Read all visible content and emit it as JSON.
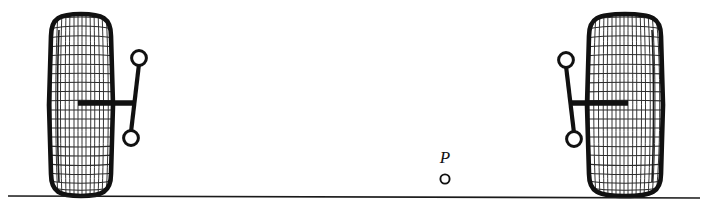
{
  "figure": {
    "background_color": "#ffffff",
    "ink_color": "#111111",
    "width": 704,
    "height": 216
  },
  "ground": {
    "label": "ground-line",
    "x1": 8,
    "y1": 196,
    "x2": 700,
    "y2": 198,
    "stroke_width": 1.6,
    "color": "#1a1a1a"
  },
  "wheels": [
    {
      "name": "left-wheel",
      "side": "left",
      "center_x": 81,
      "center_y": 105,
      "half_width": 30,
      "half_height": 91,
      "outline_width": 4.5,
      "mesh_color": "#262626",
      "mesh_vertical_lines": 15,
      "mesh_horizontal_lines": 21
    },
    {
      "name": "right-wheel",
      "side": "right",
      "center_x": 625,
      "center_y": 105,
      "half_width": 36,
      "half_height": 91,
      "outline_width": 4.5,
      "mesh_color": "#262626",
      "mesh_vertical_lines": 17,
      "mesh_horizontal_lines": 21
    }
  ],
  "linkages": [
    {
      "name": "left-linkage",
      "side": "left",
      "upper_joint": {
        "cx": 139,
        "cy": 58,
        "r": 7.5
      },
      "lower_joint": {
        "cx": 131,
        "cy": 138,
        "r": 7.5
      },
      "strut": {
        "x1": 139,
        "y1": 66,
        "x2": 131,
        "y2": 130
      },
      "axle_arm": {
        "x1": 78,
        "y1": 103,
        "x2": 135,
        "y2": 103
      },
      "bar_width": 4.2,
      "arm_width": 5.5
    },
    {
      "name": "right-linkage",
      "side": "right",
      "upper_joint": {
        "cx": 566,
        "cy": 60,
        "r": 7.5
      },
      "lower_joint": {
        "cx": 574,
        "cy": 139,
        "r": 7.5
      },
      "strut": {
        "x1": 566,
        "y1": 68,
        "x2": 574,
        "y2": 131
      },
      "axle_arm": {
        "x1": 570,
        "y1": 103,
        "x2": 628,
        "y2": 103
      },
      "bar_width": 4.2,
      "arm_width": 5.5
    }
  ],
  "points": [
    {
      "name": "point-p",
      "label": "P",
      "label_x": 445,
      "label_y": 163,
      "marker_cx": 445,
      "marker_cy": 179,
      "marker_r": 4.6,
      "marker_stroke": 1.8
    }
  ]
}
